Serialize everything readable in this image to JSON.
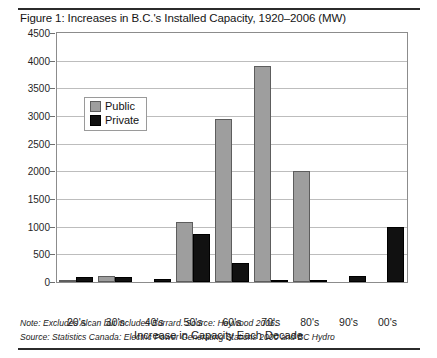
{
  "figure": {
    "title": "Figure 1: Increases in B.C.'s Installed Capacity, 1920–2006 (MW)",
    "notes": [
      "Note: Excludes Alcan but includes Burrard. Source: Heywood 2006.",
      "Source: Statistics Canada: Electric Power  Generating Stations 2000 and BC Hydro"
    ],
    "colors": {
      "public": "#9e9e9e",
      "public_border": "#5d5d5d",
      "private": "#111111",
      "grid": "#bdbdbd",
      "frame": "#8c8c8c",
      "rule": "#2b2b2b"
    }
  },
  "chart_data": {
    "type": "bar",
    "title": "Figure 1: Increases in B.C.'s Installed Capacity, 1920–2006 (MW)",
    "xlabel": "Increase in Capacity Each Decade",
    "ylabel": "",
    "categories": [
      "20's",
      "30's",
      "40's",
      "50's",
      "60's",
      "70's",
      "80's",
      "90's",
      "00's"
    ],
    "series": [
      {
        "name": "Public",
        "color": "#9e9e9e",
        "values": [
          20,
          110,
          0,
          1080,
          2940,
          3900,
          2000,
          0,
          0
        ]
      },
      {
        "name": "Private",
        "color": "#111111",
        "values": [
          90,
          90,
          50,
          870,
          350,
          10,
          10,
          100,
          1000
        ]
      }
    ],
    "ylim": [
      0,
      4500
    ],
    "yticks": [
      0,
      500,
      1000,
      1500,
      2000,
      2500,
      3000,
      3500,
      4000,
      4500
    ],
    "ytick_labels": [
      "0",
      "500",
      "1000",
      "1500",
      "2000",
      "2500",
      "3000",
      "3500",
      "4000",
      "4500"
    ],
    "grid": true,
    "legend_position": "upper-left-inside",
    "legend_entries": [
      "Public",
      "Private"
    ]
  }
}
